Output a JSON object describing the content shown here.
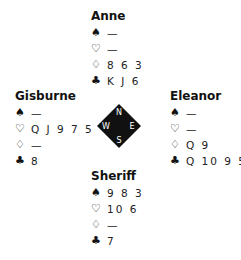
{
  "suits": {
    "spades": "♠",
    "hearts": "♡",
    "diamonds": "♢",
    "clubs": "♣"
  },
  "hands": {
    "north": {
      "name": "Anne",
      "spades": "—",
      "hearts": "—",
      "diamonds": "8 6 3",
      "clubs": "K J 6"
    },
    "west": {
      "name": "Gisburne",
      "spades": "—",
      "hearts": "Q J 9 7 5",
      "diamonds": "—",
      "clubs": "8"
    },
    "east": {
      "name": "Eleanor",
      "spades": "—",
      "hearts": "—",
      "diamonds": "Q 9",
      "clubs": "Q 10 9 5"
    },
    "south": {
      "name": "Sheriff",
      "spades": "9 8 3",
      "hearts": "10 6",
      "diamonds": "—",
      "clubs": "7"
    }
  },
  "compass": {
    "n": "N",
    "e": "E",
    "s": "S",
    "w": "W"
  }
}
